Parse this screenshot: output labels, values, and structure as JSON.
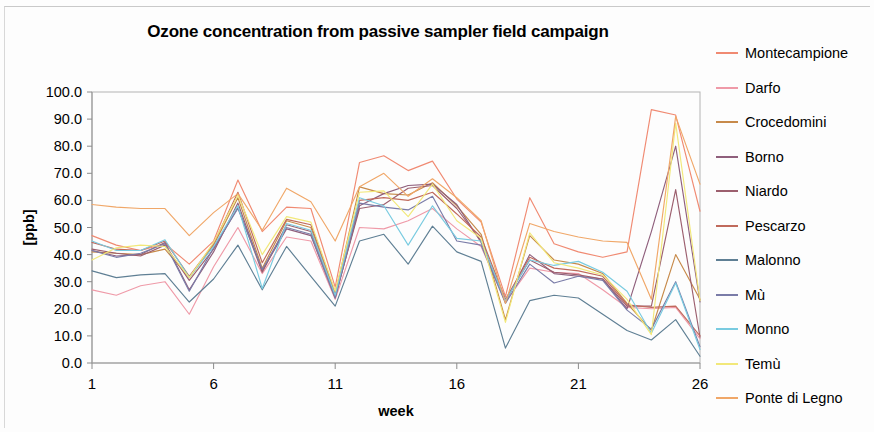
{
  "figure": {
    "title": "Ozone concentration from passive sampler field campaign"
  },
  "axes": {
    "ylabel": "[ppb]",
    "xlabel": "week",
    "y_ticks": [
      "0.0",
      "10.0",
      "20.0",
      "30.0",
      "40.0",
      "50.0",
      "60.0",
      "70.0",
      "80.0",
      "90.0",
      "100.0"
    ],
    "x_ticks": [
      "1",
      "6",
      "11",
      "16",
      "21",
      "26"
    ]
  },
  "legend": {
    "position": "right",
    "items": [
      {
        "label": "Montecampione",
        "color": "#f08a72"
      },
      {
        "label": "Darfo",
        "color": "#ef9aa8"
      },
      {
        "label": "Crocedomini",
        "color": "#c78a4a"
      },
      {
        "label": "Borno",
        "color": "#8f5f7c"
      },
      {
        "label": "Niardo",
        "color": "#9c5f6e"
      },
      {
        "label": "Pescarzo",
        "color": "#c06a5c"
      },
      {
        "label": "Malonno",
        "color": "#5f7f94"
      },
      {
        "label": "Mù",
        "color": "#7a7ca8"
      },
      {
        "label": "Monno",
        "color": "#79cbe0"
      },
      {
        "label": "Temù",
        "color": "#f2e87a"
      },
      {
        "label": "Ponte di Legno",
        "color": "#f0a768"
      }
    ]
  },
  "chart_data": {
    "type": "line",
    "title": "Ozone concentration from passive sampler field campaign",
    "xlabel": "week",
    "ylabel": "[ppb]",
    "xlim": [
      1,
      26
    ],
    "ylim": [
      0,
      100
    ],
    "ytick_step": 10,
    "grid": false,
    "legend_position": "right",
    "x": [
      1,
      2,
      3,
      4,
      5,
      6,
      7,
      8,
      9,
      10,
      11,
      12,
      13,
      14,
      15,
      16,
      17,
      18,
      19,
      20,
      21,
      22,
      23,
      24,
      25,
      26
    ],
    "series": [
      {
        "name": "Montecampione",
        "color": "#f08a72",
        "values": [
          47.0,
          43.5,
          41.5,
          44.0,
          36.5,
          45.0,
          67.5,
          48.5,
          57.5,
          57.0,
          28.0,
          74.0,
          76.5,
          71.0,
          74.5,
          60.5,
          52.0,
          24.5,
          61.0,
          44.0,
          41.0,
          39.0,
          41.0,
          93.5,
          91.5,
          56.0
        ]
      },
      {
        "name": "Darfo",
        "color": "#ef9aa8",
        "values": [
          27.0,
          25.0,
          28.5,
          30.0,
          18.0,
          35.5,
          50.0,
          33.0,
          46.5,
          45.0,
          23.5,
          50.0,
          49.5,
          52.5,
          57.0,
          49.5,
          43.0,
          22.5,
          35.0,
          33.5,
          33.0,
          27.0,
          20.5,
          20.0,
          20.5,
          9.0
        ]
      },
      {
        "name": "Crocedomini",
        "color": "#c78a4a",
        "values": [
          41.0,
          40.5,
          40.0,
          42.0,
          31.5,
          43.5,
          61.0,
          35.0,
          52.5,
          50.0,
          25.5,
          65.0,
          62.5,
          62.0,
          66.5,
          58.0,
          47.5,
          16.0,
          47.0,
          38.0,
          36.5,
          33.0,
          22.0,
          12.0,
          40.0,
          23.5
        ]
      },
      {
        "name": "Borno",
        "color": "#8f5f7c",
        "values": [
          41.5,
          39.5,
          40.0,
          44.5,
          27.0,
          41.0,
          59.0,
          34.0,
          49.5,
          47.0,
          24.0,
          58.0,
          62.5,
          65.5,
          66.0,
          58.5,
          44.5,
          22.5,
          40.0,
          33.0,
          32.0,
          31.0,
          20.0,
          48.5,
          80.0,
          22.5
        ]
      },
      {
        "name": "Niardo",
        "color": "#9c5f6e",
        "values": [
          42.0,
          40.5,
          39.5,
          43.5,
          30.5,
          42.0,
          57.5,
          33.5,
          51.0,
          48.5,
          24.5,
          57.0,
          58.5,
          64.5,
          65.5,
          57.0,
          45.0,
          23.0,
          38.0,
          33.5,
          32.5,
          31.0,
          21.0,
          21.0,
          64.0,
          9.5
        ]
      },
      {
        "name": "Pescarzo",
        "color": "#c06a5c",
        "values": [
          44.5,
          42.0,
          41.5,
          45.0,
          32.0,
          44.0,
          63.0,
          37.0,
          53.0,
          51.0,
          26.0,
          60.0,
          61.0,
          60.0,
          63.0,
          55.0,
          46.5,
          23.5,
          39.0,
          35.0,
          34.0,
          32.0,
          21.5,
          20.5,
          21.0,
          10.0
        ]
      },
      {
        "name": "Malonno",
        "color": "#5f7f94",
        "values": [
          34.0,
          31.5,
          32.5,
          33.0,
          22.5,
          31.0,
          43.5,
          27.0,
          43.0,
          32.0,
          21.0,
          45.0,
          47.5,
          36.5,
          50.5,
          41.0,
          37.5,
          5.5,
          23.0,
          25.0,
          24.0,
          18.0,
          12.0,
          8.5,
          16.0,
          2.5
        ]
      },
      {
        "name": "Mù",
        "color": "#7a7ca8",
        "values": [
          41.5,
          39.0,
          40.5,
          44.0,
          26.5,
          42.5,
          57.0,
          34.5,
          50.0,
          47.5,
          24.0,
          59.0,
          57.5,
          56.5,
          61.5,
          45.0,
          43.5,
          22.0,
          36.5,
          29.5,
          32.0,
          30.5,
          19.5,
          12.5,
          30.0,
          6.0
        ]
      },
      {
        "name": "Monno",
        "color": "#79cbe0",
        "values": [
          45.0,
          41.5,
          41.5,
          45.5,
          31.5,
          43.0,
          58.0,
          27.5,
          51.5,
          49.0,
          25.0,
          61.0,
          58.0,
          43.5,
          58.0,
          46.0,
          45.0,
          23.0,
          38.0,
          36.0,
          37.5,
          33.5,
          26.5,
          11.0,
          29.5,
          5.0
        ]
      },
      {
        "name": "Temù",
        "color": "#f2e87a",
        "values": [
          38.0,
          42.5,
          43.5,
          43.0,
          31.5,
          44.5,
          62.0,
          40.0,
          54.0,
          52.0,
          26.5,
          63.0,
          63.5,
          54.0,
          66.0,
          52.5,
          46.0,
          15.0,
          48.0,
          37.0,
          35.0,
          32.5,
          23.5,
          10.5,
          88.5,
          23.0
        ]
      },
      {
        "name": "Ponte di Legno",
        "color": "#f0a768",
        "values": [
          58.5,
          57.5,
          57.0,
          57.0,
          47.0,
          55.5,
          62.5,
          49.0,
          64.5,
          59.5,
          45.0,
          65.0,
          70.0,
          61.5,
          68.0,
          61.0,
          52.5,
          22.0,
          51.5,
          48.5,
          46.5,
          45.0,
          44.5,
          23.5,
          91.0,
          66.0
        ]
      }
    ]
  }
}
